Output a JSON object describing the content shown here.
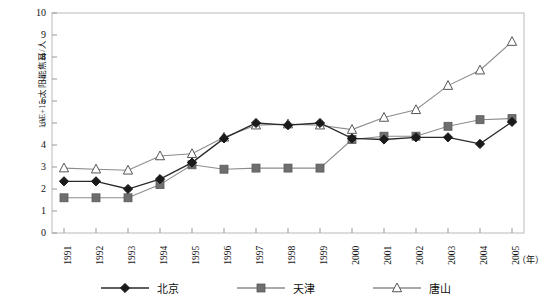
{
  "axes": {
    "y_title": "10E+15 太阳能焦耳/人",
    "y_ticks": [
      "10",
      "9",
      "8",
      "7",
      "6",
      "5",
      "4",
      "3",
      "2",
      "1",
      "0"
    ],
    "x_unit": "（年）"
  },
  "legend": {
    "items": [
      {
        "label": "北京",
        "marker": "diamond",
        "color": "#1a1a1a"
      },
      {
        "label": "天津",
        "marker": "square",
        "color": "#6e6e6e"
      },
      {
        "label": "唐山",
        "marker": "triangle",
        "color": "#8a8a8a"
      }
    ]
  },
  "chart_data": {
    "type": "line",
    "title": "",
    "xlabel": "（年）",
    "ylabel": "10E+15 太阳能焦耳/人",
    "ylim": [
      0,
      10
    ],
    "yticks": [
      0,
      1,
      2,
      3,
      4,
      5,
      6,
      7,
      8,
      9,
      10
    ],
    "grid": false,
    "legend_position": "bottom",
    "categories": [
      "1991",
      "1992",
      "1993",
      "1994",
      "1995",
      "1996",
      "1997",
      "1998",
      "1999",
      "2000",
      "2001",
      "2002",
      "2003",
      "2004",
      "2005"
    ],
    "series": [
      {
        "name": "北京",
        "marker": "diamond",
        "color": "#1a1a1a",
        "values": [
          2.35,
          2.35,
          2.0,
          2.45,
          3.2,
          4.3,
          5.0,
          4.9,
          5.0,
          4.3,
          4.25,
          4.35,
          4.35,
          4.05,
          5.05
        ]
      },
      {
        "name": "天津",
        "marker": "square",
        "color": "#6e6e6e",
        "values": [
          1.6,
          1.6,
          1.6,
          2.2,
          3.1,
          2.9,
          2.95,
          2.95,
          2.95,
          4.25,
          4.4,
          4.4,
          4.85,
          5.15,
          5.2
        ]
      },
      {
        "name": "唐山",
        "marker": "triangle",
        "color": "#8a8a8a",
        "values": [
          2.95,
          2.9,
          2.85,
          3.5,
          3.6,
          4.35,
          4.9,
          4.95,
          4.9,
          4.7,
          5.25,
          5.6,
          6.7,
          7.4,
          8.7
        ]
      }
    ]
  }
}
